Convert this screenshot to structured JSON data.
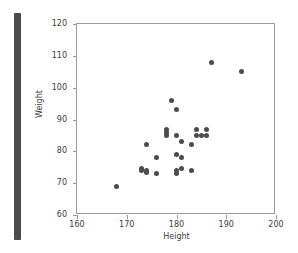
{
  "figure": {
    "background_color": "#ffffff",
    "frame_color": "#9a9a9a",
    "marker_color": "#4c4c4c",
    "left_bar_color": "#4a4a4a"
  },
  "chart_data": {
    "type": "scatter",
    "title": "",
    "xlabel": "Height",
    "ylabel": "Weight",
    "xlim": [
      160,
      200
    ],
    "ylim": [
      60,
      120
    ],
    "xticks": [
      160,
      170,
      180,
      190,
      200
    ],
    "yticks": [
      60,
      70,
      80,
      90,
      100,
      110,
      120
    ],
    "grid": false,
    "legend": null,
    "series": [
      {
        "name": "observations",
        "x": [
          168,
          173,
          173,
          174,
          174,
          174,
          176,
          176,
          178,
          178,
          178,
          179,
          180,
          180,
          180,
          180,
          180,
          181,
          181,
          181,
          183,
          183,
          184,
          184,
          185,
          186,
          186,
          187,
          193
        ],
        "y": [
          69,
          74,
          74.5,
          74,
          73.5,
          82,
          73,
          78,
          86,
          85,
          87,
          96,
          93,
          85,
          79,
          73,
          74,
          74.5,
          83,
          78,
          82,
          74,
          85,
          87,
          85,
          87,
          85,
          108,
          105
        ]
      }
    ]
  }
}
